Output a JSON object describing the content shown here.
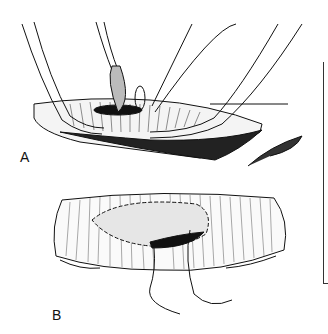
{
  "figure": {
    "panels": [
      {
        "label": "A",
        "description": "Surgical instruments (forceps and scissors) holding open an incision in tissue"
      },
      {
        "label": "B",
        "description": "Incision closed with a running suture, two suture ends trailing below"
      }
    ]
  },
  "colors": {
    "ink": "#111111",
    "background": "#ffffff"
  }
}
